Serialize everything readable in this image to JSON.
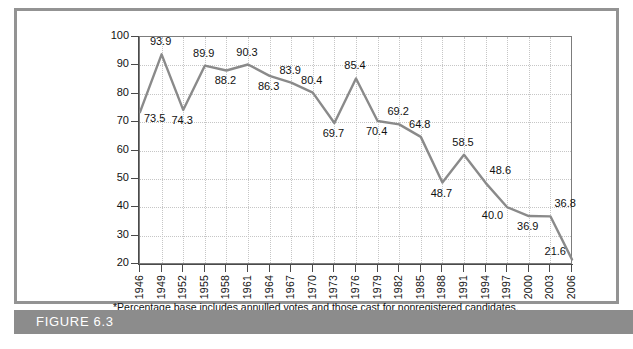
{
  "figure": {
    "bar_label": "FIGURE 6.3"
  },
  "footnote": "*Percentage base includes annulled votes and those cast for nonregistered candidates.",
  "colors": {
    "line": "#8a8a8a",
    "axis": "#4a4a4a",
    "grid": "#c6c6c6",
    "frame": "#939393",
    "figure_bar": "#8c8c8c",
    "text": "#111111"
  },
  "chart_data": {
    "type": "line",
    "title": "",
    "xlabel": "",
    "ylabel": "Percentage of Total Voters*",
    "ylim": [
      20,
      100
    ],
    "ytick_step": 10,
    "yticks": [
      100,
      90,
      80,
      70,
      60,
      50,
      40,
      30,
      20
    ],
    "grid": true,
    "legend": "none",
    "categories": [
      "1946",
      "1949",
      "1952",
      "1955",
      "1958",
      "1961",
      "1964",
      "1967",
      "1970",
      "1973",
      "1976",
      "1979",
      "1982",
      "1985",
      "1988",
      "1991",
      "1994",
      "1997",
      "2000",
      "2003",
      "2006"
    ],
    "values": [
      73.5,
      93.9,
      74.3,
      89.9,
      88.2,
      90.3,
      86.3,
      83.9,
      80.4,
      69.7,
      85.4,
      70.4,
      69.2,
      64.8,
      48.7,
      58.5,
      48.6,
      40.0,
      36.9,
      36.8,
      21.6
    ],
    "point_labels": [
      "73.5",
      "93.9",
      "74.3",
      "89.9",
      "88.2",
      "90.3",
      "86.3",
      "83.9",
      "80.4",
      "69.7",
      "85.4",
      "70.4",
      "69.2",
      "64.8",
      "48.7",
      "58.5",
      "48.6",
      "40.0",
      "36.9",
      "36.8",
      "21.6"
    ],
    "label_positions": [
      "below-right",
      "above",
      "below",
      "above",
      "below",
      "above",
      "below",
      "above",
      "above",
      "below",
      "above",
      "below",
      "above",
      "above",
      "below",
      "above",
      "above-right",
      "below-left",
      "below",
      "above-right",
      "left"
    ]
  }
}
